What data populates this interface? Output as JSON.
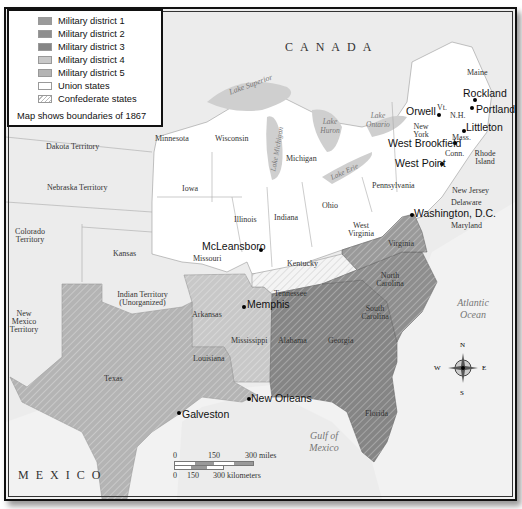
{
  "legend": {
    "items": [
      {
        "label": "Military district 1",
        "color": "#9a9a9a",
        "pattern": "solid"
      },
      {
        "label": "Military district 2",
        "color": "#8e8e8e",
        "pattern": "solid"
      },
      {
        "label": "Military district 3",
        "color": "#858585",
        "pattern": "solid"
      },
      {
        "label": "Military district 4",
        "color": "#c8c8c8",
        "pattern": "solid"
      },
      {
        "label": "Military district 5",
        "color": "#b4b4b4",
        "pattern": "solid"
      },
      {
        "label": "Union states",
        "color": "#ffffff",
        "pattern": "solid"
      },
      {
        "label": "Confederate states",
        "color": "#ffffff",
        "pattern": "hatched"
      }
    ],
    "note": "Map shows boundaries of 1867"
  },
  "regions": {
    "canada": "CANADA",
    "mexico": "MEXICO"
  },
  "water": {
    "lake_superior": "Lake Superior",
    "lake_michigan": "Lake Michigan",
    "lake_huron": "Lake Huron",
    "lake_ontario": "Lake Ontario",
    "lake_erie": "Lake Erie",
    "atlantic": "Atlantic Ocean",
    "gulf": "Gulf of Mexico"
  },
  "states": {
    "maine": "Maine",
    "vt": "Vt.",
    "nh": "N.H.",
    "mass": "Mass.",
    "conn": "Conn.",
    "ri": "Rhode Island",
    "ny": "New York",
    "pa": "Pennsylvania",
    "nj": "New Jersey",
    "de": "Delaware",
    "md": "Maryland",
    "minnesota": "Minnesota",
    "wisconsin": "Wisconsin",
    "michigan": "Michigan",
    "iowa": "Iowa",
    "illinois": "Illinois",
    "indiana": "Indiana",
    "ohio": "Ohio",
    "wv": "West Virginia",
    "missouri": "Missouri",
    "kentucky": "Kentucky",
    "dakota": "Dakota Territory",
    "nebraska": "Nebraska Territory",
    "colorado": "Colorado Territory",
    "kansas": "Kansas",
    "new_mexico": "New Mexico Territory",
    "indian": "Indian Territory (Unorganized)",
    "texas": "Texas",
    "arkansas": "Arkansas",
    "louisiana": "Louisiana",
    "mississippi": "Mississippi",
    "tennessee": "Tennessee",
    "alabama": "Alabama",
    "georgia": "Georgia",
    "florida": "Florida",
    "virginia": "Virginia",
    "nc": "North Carolina",
    "sc": "South Carolina"
  },
  "cities": [
    {
      "name": "Rockland"
    },
    {
      "name": "Portland"
    },
    {
      "name": "Orwell"
    },
    {
      "name": "Littleton"
    },
    {
      "name": "West Brookfield"
    },
    {
      "name": "West Point"
    },
    {
      "name": "Washington, D.C."
    },
    {
      "name": "McLeansboro"
    },
    {
      "name": "Memphis"
    },
    {
      "name": "New Orleans"
    },
    {
      "name": "Galveston"
    }
  ],
  "scale": {
    "miles_ticks": [
      "0",
      "150",
      "300 miles"
    ],
    "km_ticks": [
      "0",
      "150",
      "300 kilometers"
    ]
  },
  "compass": {
    "n": "N",
    "s": "S",
    "e": "E",
    "w": "W"
  }
}
